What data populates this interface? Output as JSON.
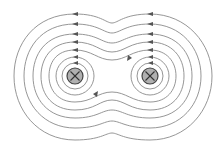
{
  "diagram": {
    "title": "",
    "colors": {
      "field_line": "#8a8a8a",
      "arrow": "#555555",
      "conductor_fill": "#b0b0b0",
      "conductor_stroke": "#444444"
    },
    "conductors": [
      {
        "id": "left",
        "cx": 75,
        "cy": 76,
        "r": 8,
        "symbol": "cross",
        "direction": "into-page"
      },
      {
        "id": "right",
        "cx": 150,
        "cy": 76,
        "r": 8,
        "symbol": "cross",
        "direction": "into-page"
      }
    ],
    "inner_loops_per_conductor": 2,
    "enclosing_loops": 5,
    "arrow_direction": "counter-clockwise"
  }
}
